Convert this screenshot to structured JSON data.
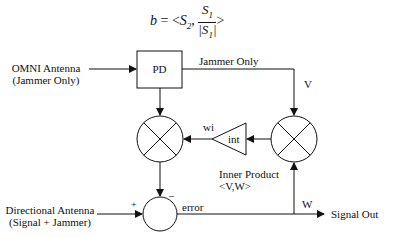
{
  "formula": {
    "lhs": "b",
    "eq": " = <",
    "s2": "S",
    "s2_sub": "2",
    "comma": ", ",
    "num": "S",
    "num_sub": "1",
    "den": "|S",
    "den_sub": "1",
    "den_end": "|",
    "close": ">"
  },
  "inputs": {
    "omni_line1": "OMNI Antenna",
    "omni_line2": "(Jammer Only)",
    "directional_line1": "Directional Antenna",
    "directional_line2": "(Signal + Jammer)"
  },
  "blocks": {
    "pd": "PD",
    "int": "int"
  },
  "signals": {
    "jammer_only": "Jammer Only",
    "v": "V",
    "wi": "wi",
    "w": "W",
    "error": "error",
    "plus": "+",
    "minus": "–",
    "signal_out": "Signal Out",
    "inner_product_line1": "Inner Product",
    "inner_product_line2": "<V,W>"
  },
  "colors": {
    "stroke": "#111111",
    "background": "#ffffff"
  }
}
